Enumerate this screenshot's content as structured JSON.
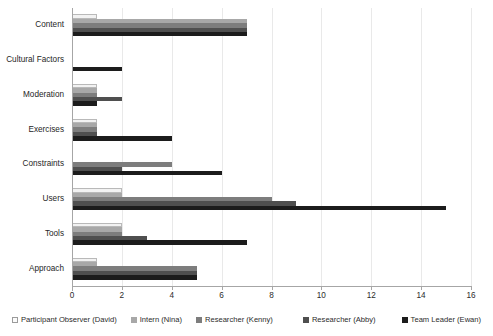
{
  "chart_data": {
    "type": "bar",
    "orientation": "horizontal",
    "title": "",
    "xlabel": "",
    "ylabel": "",
    "xlim": [
      0,
      16
    ],
    "xticks": [
      0,
      2,
      4,
      6,
      8,
      10,
      12,
      14,
      16
    ],
    "grid": true,
    "legend_position": "bottom",
    "categories": [
      "Content",
      "Cultural Factors",
      "Moderation",
      "Exercises",
      "Constraints",
      "Users",
      "Tools",
      "Approach"
    ],
    "series": [
      {
        "name": "Participant Observer (David)",
        "color": "#f2f2f2",
        "values": [
          1,
          0,
          1,
          1,
          0,
          2,
          2,
          1
        ]
      },
      {
        "name": "Intern (Nina)",
        "color": "#a8a8a8",
        "values": [
          7,
          0,
          1,
          1,
          0,
          2,
          2,
          1
        ]
      },
      {
        "name": "Researcher (Kenny)",
        "color": "#7d7d7d",
        "values": [
          7,
          0,
          1,
          1,
          4,
          8,
          2,
          5
        ]
      },
      {
        "name": "Researcher (Abby)",
        "color": "#4f4f4f",
        "values": [
          7,
          0,
          2,
          1,
          2,
          9,
          3,
          5
        ]
      },
      {
        "name": "Team Leader (Ewan)",
        "color": "#1c1c1c",
        "values": [
          7,
          2,
          1,
          4,
          6,
          15,
          7,
          5
        ]
      }
    ]
  }
}
